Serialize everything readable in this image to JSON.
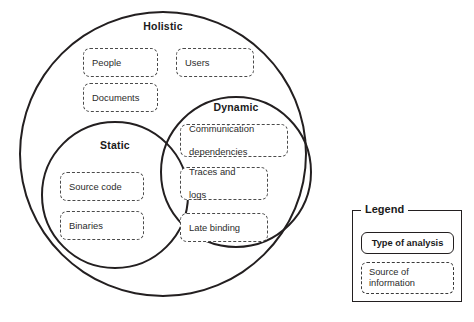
{
  "figure": {
    "type": "venn-diagram",
    "sets": [
      {
        "id": "holistic",
        "label": "Holistic",
        "items": [
          "People",
          "Users",
          "Documents"
        ]
      },
      {
        "id": "static",
        "label": "Static",
        "items": [
          "Source code",
          "Binaries"
        ]
      },
      {
        "id": "dynamic",
        "label": "Dynamic",
        "items": [
          "Communication dependencies",
          "Traces and logs",
          "Late binding"
        ]
      }
    ]
  },
  "boxes": {
    "people": "People",
    "users": "Users",
    "documents": "Documents",
    "communication_dependencies_line1": "Communication",
    "communication_dependencies_line2": "dependencies",
    "traces_and_logs_line1": "Traces and",
    "traces_and_logs_line2": "logs",
    "late_binding": "Late binding",
    "source_code": "Source code",
    "binaries": "Binaries"
  },
  "legend": {
    "title": "Legend",
    "type_of_analysis": "Type of analysis",
    "source_of_information_line1": "Source of",
    "source_of_information_line2": "information"
  },
  "colors": {
    "stroke": "#231f20",
    "dashed_stroke": "#4a4a4a",
    "background": "#ffffff",
    "text": "#1a1a1a"
  }
}
